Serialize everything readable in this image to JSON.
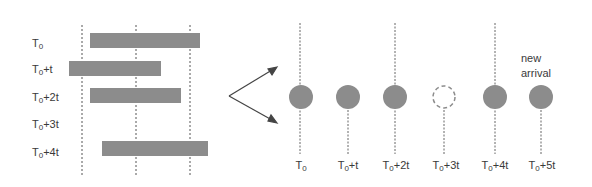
{
  "left_panel": {
    "rows": [
      {
        "base": "T",
        "sub": "0",
        "suffix": "",
        "bar": {
          "x1": 90,
          "x2": 200
        }
      },
      {
        "base": "T",
        "sub": "0",
        "suffix": "+t",
        "bar": {
          "x1": 69,
          "x2": 161
        }
      },
      {
        "base": "T",
        "sub": "0",
        "suffix": "+2t",
        "bar": {
          "x1": 90,
          "x2": 181
        }
      },
      {
        "base": "T",
        "sub": "0",
        "suffix": "+3t",
        "bar": null
      },
      {
        "base": "T",
        "sub": "0",
        "suffix": "+4t",
        "bar": {
          "x1": 102,
          "x2": 208
        }
      }
    ],
    "grid_lines_x": [
      82,
      136,
      190
    ]
  },
  "right_panel": {
    "slots": [
      {
        "base": "T",
        "sub": "0",
        "suffix": "",
        "state": "filled",
        "line_top": true
      },
      {
        "base": "T",
        "sub": "0",
        "suffix": "+t",
        "state": "filled",
        "line_top": false
      },
      {
        "base": "T",
        "sub": "0",
        "suffix": "+2t",
        "state": "filled",
        "line_top": true
      },
      {
        "base": "T",
        "sub": "0",
        "suffix": "+3t",
        "state": "empty",
        "line_top": false
      },
      {
        "base": "T",
        "sub": "0",
        "suffix": "+4t",
        "state": "filled",
        "line_top": true
      },
      {
        "base": "T",
        "sub": "0",
        "suffix": "+5t",
        "state": "filled",
        "line_top": false
      }
    ],
    "annotation": {
      "line1": "new",
      "line2": "arrival"
    }
  },
  "colors": {
    "bar": "#8c8c8c",
    "circle": "#8c8c8c",
    "line": "#555555",
    "text": "#3a3a3a"
  }
}
